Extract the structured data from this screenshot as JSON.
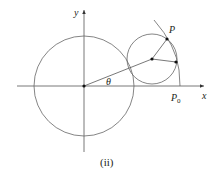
{
  "figure": {
    "caption": "(ii)",
    "labels": {
      "y_axis": "y",
      "x_axis": "x",
      "angle": "θ",
      "point_p": "P",
      "point_p0": "P",
      "point_p0_sub": "0"
    },
    "colors": {
      "stroke": "#555555",
      "text": "#231f20"
    }
  }
}
